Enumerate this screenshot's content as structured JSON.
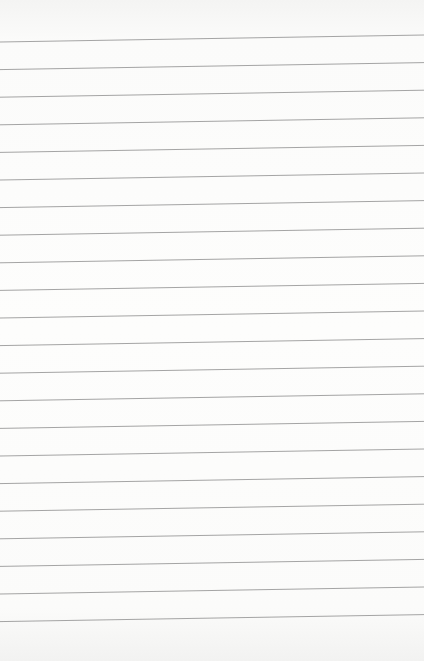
{
  "page": {
    "type": "lined-paper",
    "background_color": "#fdfdfc",
    "line_color": "#9a9a9a",
    "line_count": 22,
    "first_line_y_left": 42,
    "first_line_y_right": 35,
    "line_spacing": 27.6
  }
}
